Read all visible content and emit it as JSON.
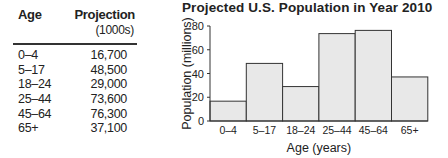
{
  "table": {
    "headers": {
      "age": "Age",
      "projection": "Projection",
      "projection_unit": "(1000s)"
    },
    "rows": [
      {
        "age": "0–4",
        "projection": "16,700"
      },
      {
        "age": "5–17",
        "projection": "48,500"
      },
      {
        "age": "18–24",
        "projection": "29,000"
      },
      {
        "age": "25–44",
        "projection": "73,600"
      },
      {
        "age": "45–64",
        "projection": "76,300"
      },
      {
        "age": "65+",
        "projection": "37,100"
      }
    ]
  },
  "chart_data": {
    "type": "bar",
    "title": "Projected U.S. Population in Year 2010",
    "xlabel": "Age (years)",
    "ylabel": "Population (millions)",
    "categories": [
      "0–4",
      "5–17",
      "18–24",
      "25–44",
      "45–64",
      "65+"
    ],
    "values": [
      16.7,
      48.5,
      29.0,
      73.6,
      76.3,
      37.1
    ],
    "ylim": [
      0,
      80
    ],
    "yticks": [
      0,
      20,
      40,
      60,
      80
    ],
    "grid": false,
    "bar_fill": "#e8e8e8",
    "bar_stroke": "#333333"
  }
}
